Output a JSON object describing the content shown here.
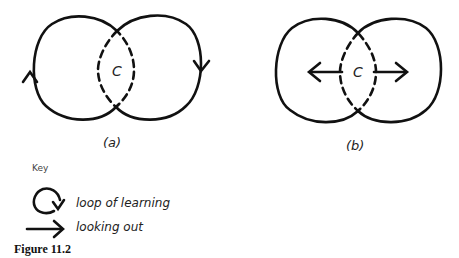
{
  "figure": {
    "caption": "Figure 11.2",
    "diagrams": [
      {
        "id": "a",
        "label": "(a)",
        "center_label": "C",
        "arrow_type": "loop-of-learning",
        "description": "Two overlapping loops with a dashed overlap region C; arrows indicate circular flow (up on left, down on right)"
      },
      {
        "id": "b",
        "label": "(b)",
        "center_label": "C",
        "arrow_type": "looking-out",
        "description": "Two overlapping loops with a dashed overlap region C; arrows point outward from C to left and right"
      }
    ],
    "key": {
      "title": "Key",
      "items": [
        {
          "icon": "loop-arrow-icon",
          "label": "loop of learning"
        },
        {
          "icon": "straight-arrow-icon",
          "label": "looking out"
        }
      ]
    }
  }
}
